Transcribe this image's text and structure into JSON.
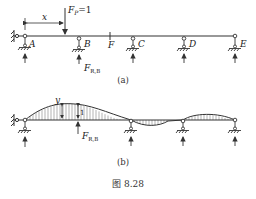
{
  "figure": {
    "caption": "图 8.28",
    "sub_a": "(a)",
    "sub_b": "(b)"
  },
  "diagram_a": {
    "load_label": "F",
    "load_sub": "P",
    "load_value": "=1",
    "distance_label": "x",
    "supports": [
      "A",
      "B",
      "C",
      "D",
      "E"
    ],
    "hinge_label": "F",
    "reaction_label": "F",
    "reaction_sub": "R,B"
  },
  "diagram_b": {
    "ordinate_label": "y",
    "unit_label": "1",
    "reaction_label": "F",
    "reaction_sub": "R,B"
  },
  "colors": {
    "line": "#333333",
    "text": "#222222"
  }
}
